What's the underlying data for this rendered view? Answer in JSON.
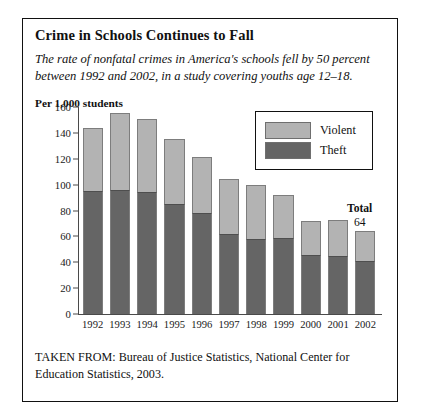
{
  "figure": {
    "title": "Crime in Schools Continues to Fall",
    "subtitle": "The rate of nonfatal crimes in America's schools fell by 50 percent between 1992 and 2002, in a study covering youths age 12–18.",
    "axis_note": "Per 1,000 students",
    "source": "TAKEN FROM: Bureau of Justice Statistics, National Center for Education Statistics, 2003."
  },
  "legend": {
    "position": "top-right",
    "items": [
      {
        "label": "Violent",
        "color": "#b3b3b3"
      },
      {
        "label": "Theft",
        "color": "#656565"
      }
    ]
  },
  "annotation": {
    "label": "Total",
    "value": "64",
    "target_year": "2002"
  },
  "chart_data": {
    "type": "bar",
    "stacked": true,
    "title": "Crime in Schools Continues to Fall",
    "subtitle": "The rate of nonfatal crimes in America's schools fell by 50 percent between 1992 and 2002, in a study covering youths age 12–18.",
    "xlabel": "",
    "ylabel": "Per 1,000 students",
    "ylim": [
      0,
      160
    ],
    "yticks": [
      0,
      20,
      40,
      60,
      80,
      100,
      120,
      140,
      160
    ],
    "grid": false,
    "legend_position": "top-right",
    "categories": [
      "1992",
      "1993",
      "1994",
      "1995",
      "1996",
      "1997",
      "1998",
      "1999",
      "2000",
      "2001",
      "2002"
    ],
    "series": [
      {
        "name": "Theft",
        "color": "#656565",
        "values": [
          95,
          96,
          94,
          85,
          78,
          62,
          58,
          59,
          46,
          45,
          41
        ]
      },
      {
        "name": "Violent",
        "color": "#b3b3b3",
        "values": [
          49,
          59,
          57,
          50,
          43,
          42,
          42,
          33,
          26,
          28,
          23
        ]
      }
    ],
    "totals": [
      144,
      155,
      151,
      135,
      121,
      104,
      100,
      92,
      72,
      73,
      64
    ],
    "annotations": [
      {
        "text": "Total 64",
        "year": "2002",
        "value": 64
      }
    ]
  }
}
